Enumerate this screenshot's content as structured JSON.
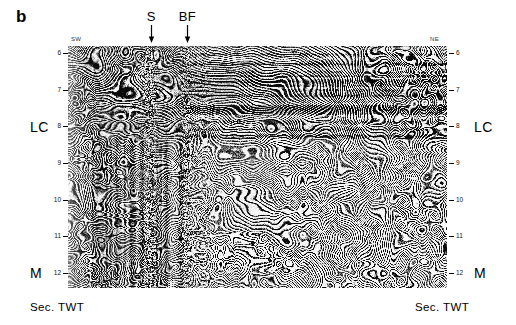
{
  "panel": {
    "letter": "b"
  },
  "section": {
    "orientation_left": "SW",
    "orientation_right": "NE",
    "unit_label_left": "Sec. TWT",
    "unit_label_right": "Sec. TWT"
  },
  "annotations": [
    {
      "label": "S",
      "name": "annotation-s",
      "arrow": "down-arrow-icon"
    },
    {
      "label": "BF",
      "name": "annotation-bf",
      "arrow": "down-arrow-icon"
    }
  ],
  "axis": {
    "title": "Sec. TWT",
    "ticks": [
      "6",
      "7",
      "8",
      "9",
      "10",
      "11",
      "12"
    ],
    "tick_values": [
      6,
      7,
      8,
      9,
      10,
      11,
      12
    ],
    "range": [
      5.8,
      12.4
    ]
  },
  "horizons": [
    {
      "label": "LC",
      "time": 8,
      "name": "horizon-lower-crust"
    },
    {
      "label": "M",
      "time": 12,
      "name": "horizon-moho"
    }
  ],
  "chart_data": {
    "type": "heatmap",
    "title": "",
    "xlabel": "",
    "ylabel": "Sec. TWT",
    "ylim": [
      5.8,
      12.4
    ],
    "x_endpoints": [
      "SW",
      "NE"
    ],
    "tick_labels": [
      "6",
      "7",
      "8",
      "9",
      "10",
      "11",
      "12"
    ],
    "annotations": [
      {
        "label": "S",
        "x_frac": 0.22
      },
      {
        "label": "BF",
        "x_frac": 0.315
      },
      {
        "label": "LC",
        "y_time": 8
      },
      {
        "label": "M",
        "y_time": 12
      }
    ],
    "grid": false,
    "legend": "none"
  },
  "colors": {
    "ink": "#000000",
    "paper": "#ffffff",
    "axis": "#111111"
  }
}
